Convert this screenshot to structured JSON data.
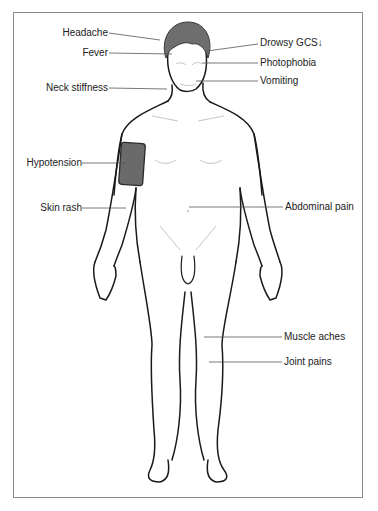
{
  "diagram": {
    "type": "anatomical-symptom-diagram",
    "colors": {
      "outline": "#1a1a1a",
      "hair": "#6e6e6e",
      "cuff": "#6a6a6a",
      "leader_line": "#555555",
      "frame": "#8a8a8a",
      "text": "#222222"
    }
  },
  "labels": {
    "left": [
      {
        "id": "headache",
        "text": "Headache"
      },
      {
        "id": "fever",
        "text": "Fever"
      },
      {
        "id": "neck_stiffness",
        "text": "Neck stiffness"
      },
      {
        "id": "hypotension",
        "text": "Hypotension"
      },
      {
        "id": "skin_rash",
        "text": "Skin rash"
      }
    ],
    "right": [
      {
        "id": "drowsy",
        "text": "Drowsy  GCS↓"
      },
      {
        "id": "photophobia",
        "text": "Photophobia"
      },
      {
        "id": "vomiting",
        "text": "Vomiting"
      },
      {
        "id": "abdominal_pain",
        "text": "Abdominal pain"
      },
      {
        "id": "muscle_aches",
        "text": "Muscle aches"
      },
      {
        "id": "joint_pains",
        "text": "Joint pains"
      }
    ]
  }
}
